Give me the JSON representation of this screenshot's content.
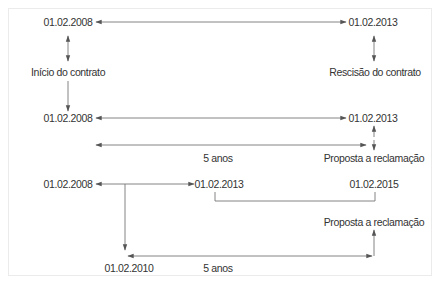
{
  "diagram": {
    "colors": {
      "line": "#555555",
      "text": "#333333",
      "frame": "#ebebeb"
    },
    "scenario1": {
      "start_date": "01.02.2008",
      "end_date": "01.02.2013",
      "start_label": "Início do contrato",
      "end_label": "Rescisão do contrato"
    },
    "scenario2": {
      "start_date": "01.02.2008",
      "end_date": "01.02.2013",
      "duration_label": "5 anos",
      "claim_label": "Proposta a reclamação"
    },
    "scenario3": {
      "start_date": "01.02.2008",
      "mid_date": "01.02.2013",
      "extended_date": "01.02.2015",
      "claim_label": "Proposta a reclamação",
      "lower_date": "01.02.2010",
      "duration_label": "5 anos"
    }
  }
}
